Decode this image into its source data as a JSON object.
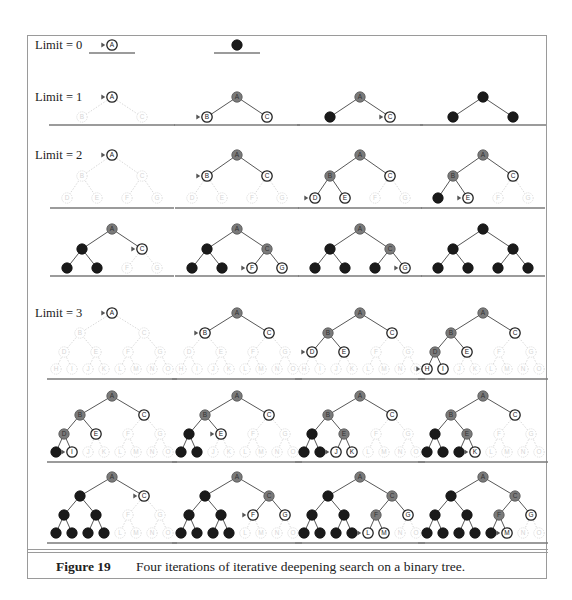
{
  "figure": {
    "number_label": "Figure 19",
    "caption": "Four iterations of iterative deepening search on a binary tree."
  },
  "colors": {
    "frame": "#9a9a9a",
    "unvisited": "#d6d6d6",
    "frontier_fill": "#ffffff",
    "frontier_stroke": "#222222",
    "expanded_fill": "#7a7a7a",
    "removed_fill": "#1a1a1a",
    "edge_active": "#444444",
    "edge_faded": "#cfcfcf",
    "baseline": "#7a7a7a"
  },
  "node_labels": [
    "A",
    "B",
    "C",
    "D",
    "E",
    "F",
    "G",
    "H",
    "I",
    "J",
    "K",
    "L",
    "M",
    "N",
    "O"
  ],
  "legend_states": {
    "u": "unvisited",
    "f": "frontier",
    "n": "frontier-next (arrow marker)",
    "e": "expanded",
    "x": "explored-removed"
  },
  "limits": [
    {
      "label": "Limit = 0",
      "label_pos": [
        35,
        40
      ],
      "depth": 0,
      "rows": [
        {
          "y_levels": [
            45
          ],
          "baseline_y": 53,
          "spreads": [],
          "trees": [
            {
              "cx": 112,
              "states": "n"
            },
            {
              "cx": 237,
              "states": "x"
            }
          ]
        }
      ]
    },
    {
      "label": "Limit = 1",
      "label_pos": [
        35,
        92
      ],
      "depth": 1,
      "rows": [
        {
          "y_levels": [
            97,
            117
          ],
          "baseline_y": 125,
          "spreads": [
            30
          ],
          "trees": [
            {
              "cx": 112,
              "states": "nuu"
            },
            {
              "cx": 237,
              "states": "enf"
            },
            {
              "cx": 360,
              "states": "exn"
            },
            {
              "cx": 483,
              "states": "xxx"
            }
          ]
        }
      ]
    },
    {
      "label": "Limit = 2",
      "label_pos": [
        35,
        150
      ],
      "depth": 2,
      "rows": [
        {
          "y_levels": [
            155,
            176,
            198
          ],
          "baseline_y": 208,
          "spreads": [
            30,
            15
          ],
          "trees": [
            {
              "cx": 112,
              "states": "nuuuuuu"
            },
            {
              "cx": 237,
              "states": "enfuuuu"
            },
            {
              "cx": 360,
              "states": "eefnfuu"
            },
            {
              "cx": 483,
              "states": "eefxnuu"
            }
          ]
        },
        {
          "y_levels": [
            229,
            249,
            268
          ],
          "baseline_y": 276,
          "spreads": [
            30,
            15
          ],
          "trees": [
            {
              "cx": 112,
              "states": "exnxxuu"
            },
            {
              "cx": 237,
              "states": "exexxnf"
            },
            {
              "cx": 360,
              "states": "exexxxn"
            },
            {
              "cx": 483,
              "states": "xxxxxxx"
            }
          ]
        }
      ]
    },
    {
      "label": "Limit = 3",
      "label_pos": [
        35,
        308
      ],
      "depth": 3,
      "rows": [
        {
          "y_levels": [
            313,
            333,
            352,
            369
          ],
          "baseline_y": 379,
          "spreads": [
            32,
            16,
            8
          ],
          "trees": [
            {
              "cx": 112,
              "states": "nuuuuuuuuuuuuuu"
            },
            {
              "cx": 237,
              "states": "enfuuuuuuuuuuuu"
            },
            {
              "cx": 360,
              "states": "eefnfuuuuuuuuuu"
            },
            {
              "cx": 483,
              "states": "eefefuunfuuuuuu"
            }
          ]
        },
        {
          "y_levels": [
            396,
            415,
            434,
            452
          ],
          "baseline_y": 462,
          "spreads": [
            32,
            16,
            8
          ],
          "trees": [
            {
              "cx": 112,
              "states": "eefefuuxnuuuuuu"
            },
            {
              "cx": 237,
              "states": "eefxnuuxxuuuuuu"
            },
            {
              "cx": 360,
              "states": "eefxeuuxxnfuuuu"
            },
            {
              "cx": 483,
              "states": "eefxeuuxxxnuuuu"
            }
          ]
        },
        {
          "y_levels": [
            477,
            496,
            515,
            533
          ],
          "baseline_y": 543,
          "spreads": [
            32,
            16,
            8
          ],
          "trees": [
            {
              "cx": 112,
              "states": "exnxxuuxxxxuuuu"
            },
            {
              "cx": 237,
              "states": "exexxnfxxxxuuuu"
            },
            {
              "cx": 360,
              "states": "exexxefxxxxnfuu"
            },
            {
              "cx": 483,
              "states": "exexxefxxxxxnuu"
            }
          ]
        }
      ]
    }
  ]
}
